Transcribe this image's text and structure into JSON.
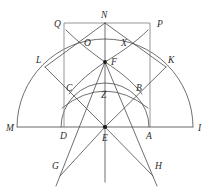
{
  "figure": {
    "width": 211,
    "height": 195,
    "stroke_color": "#4a4a4a",
    "baseline_color": "#6b6b6b",
    "rect_color": "#8a8a8a",
    "dot_color": "#1a1a1a",
    "background": "#ffffff"
  },
  "points": [
    {
      "id": "Q",
      "label": "Q",
      "x": 64,
      "y": 23,
      "lx": 54,
      "ly": 27,
      "dot": false
    },
    {
      "id": "N",
      "label": "N",
      "x": 105,
      "y": 23,
      "lx": 102,
      "ly": 18,
      "dot": false
    },
    {
      "id": "P",
      "label": "P",
      "x": 150,
      "y": 23,
      "lx": 157,
      "ly": 27,
      "dot": false
    },
    {
      "id": "L",
      "label": "L",
      "x": 48,
      "y": 65,
      "lx": 38,
      "ly": 62,
      "dot": false
    },
    {
      "id": "K",
      "label": "K",
      "x": 163,
      "y": 65,
      "lx": 168,
      "ly": 62,
      "dot": false
    },
    {
      "id": "O",
      "label": "O",
      "x": 92,
      "y": 45,
      "lx": 85,
      "ly": 44,
      "dot": false
    },
    {
      "id": "X",
      "label": "X",
      "x": 121,
      "y": 45,
      "lx": 122,
      "ly": 44,
      "dot": false
    },
    {
      "id": "F",
      "label": "F",
      "x": 105,
      "y": 62,
      "lx": 111,
      "ly": 63,
      "dot": true
    },
    {
      "id": "C",
      "label": "C",
      "x": 75,
      "y": 90,
      "lx": 67,
      "ly": 88,
      "dot": false
    },
    {
      "id": "B",
      "label": "B",
      "x": 135,
      "y": 90,
      "lx": 136,
      "ly": 88,
      "dot": false
    },
    {
      "id": "Z",
      "label": "Z",
      "x": 105,
      "y": 95,
      "lx": 102,
      "ly": 95,
      "dot": false
    },
    {
      "id": "M",
      "label": "M",
      "x": 18,
      "y": 127,
      "lx": 8,
      "ly": 130,
      "dot": false
    },
    {
      "id": "D",
      "label": "D",
      "x": 64,
      "y": 127,
      "lx": 60,
      "ly": 137,
      "dot": false
    },
    {
      "id": "E",
      "label": "E",
      "x": 105,
      "y": 127,
      "lx": 103,
      "ly": 139,
      "dot": true
    },
    {
      "id": "A",
      "label": "A",
      "x": 150,
      "y": 127,
      "lx": 147,
      "ly": 137,
      "dot": false
    },
    {
      "id": "I",
      "label": "I",
      "x": 194,
      "y": 127,
      "lx": 198,
      "ly": 130,
      "dot": false
    },
    {
      "id": "G",
      "label": "G",
      "x": 63,
      "y": 165,
      "lx": 52,
      "ly": 167,
      "dot": false
    },
    {
      "id": "H",
      "label": "H",
      "x": 150,
      "y": 165,
      "lx": 155,
      "ly": 167,
      "dot": false
    }
  ],
  "segments": [
    {
      "name": "baseline-MI",
      "x1": 18,
      "y1": 127,
      "x2": 194,
      "y2": 127,
      "kind": "base"
    },
    {
      "name": "rect-left-DQ",
      "x1": 64,
      "y1": 127,
      "x2": 64,
      "y2": 23,
      "kind": "rect"
    },
    {
      "name": "rect-top-QP",
      "x1": 64,
      "y1": 23,
      "x2": 150,
      "y2": 23,
      "kind": "rect"
    },
    {
      "name": "rect-right-PA",
      "x1": 150,
      "y1": 23,
      "x2": 150,
      "y2": 127,
      "kind": "rect"
    },
    {
      "name": "vertical-axis-NE",
      "x1": 105,
      "y1": 23,
      "x2": 105,
      "y2": 182,
      "kind": "line"
    },
    {
      "name": "ray-N-to-L",
      "x1": 105,
      "y1": 23,
      "x2": 45,
      "y2": 67,
      "kind": "line"
    },
    {
      "name": "ray-N-to-K",
      "x1": 105,
      "y1": 23,
      "x2": 166,
      "y2": 67,
      "kind": "line"
    },
    {
      "name": "chord-L-to-E",
      "x1": 45,
      "y1": 67,
      "x2": 105,
      "y2": 127,
      "kind": "line"
    },
    {
      "name": "chord-K-to-E",
      "x1": 166,
      "y1": 67,
      "x2": 105,
      "y2": 127,
      "kind": "line"
    },
    {
      "name": "ray-F-to-G",
      "x1": 105,
      "y1": 62,
      "x2": 56,
      "y2": 184,
      "kind": "line"
    },
    {
      "name": "ray-F-to-H",
      "x1": 105,
      "y1": 62,
      "x2": 157,
      "y2": 184,
      "kind": "line"
    },
    {
      "name": "ray-E-to-G",
      "x1": 105,
      "y1": 127,
      "x2": 64,
      "y2": 173,
      "kind": "line"
    },
    {
      "name": "ray-E-to-H",
      "x1": 105,
      "y1": 127,
      "x2": 149,
      "y2": 173,
      "kind": "line"
    },
    {
      "name": "ray-F-to-D",
      "x1": 105,
      "y1": 62,
      "x2": 64,
      "y2": 127,
      "kind": "line"
    },
    {
      "name": "ray-F-to-A",
      "x1": 105,
      "y1": 62,
      "x2": 150,
      "y2": 127,
      "kind": "line"
    }
  ],
  "arcs": [
    {
      "name": "outer-semicircle-MNI",
      "cx": 105,
      "cy": 127,
      "r": 88,
      "start_deg": 180,
      "end_deg": 0,
      "kind": "arc"
    },
    {
      "name": "inner-semicircle-DFA",
      "cx": 105,
      "cy": 127,
      "r": 44,
      "start_deg": 180,
      "end_deg": 0,
      "kind": "arc"
    },
    {
      "name": "flat-arc-C-Z-B",
      "cx": 105,
      "cy": 140,
      "r": 53,
      "start_deg": 215,
      "end_deg": 325,
      "kind": "arc"
    },
    {
      "name": "upper-arc-N-to-F-left",
      "cx": 64,
      "cy": 127,
      "r": 88,
      "start_deg": 285,
      "end_deg": 318,
      "kind": "arc"
    },
    {
      "name": "upper-arc-N-to-F-right",
      "cx": 150,
      "cy": 127,
      "r": 88,
      "start_deg": 222,
      "end_deg": 255,
      "kind": "arc"
    }
  ],
  "arc_paths": [
    {
      "name": "outer-semicircle",
      "d": "M 17 127 A 88 88 0 0 1 193 127"
    },
    {
      "name": "inner-semicircle",
      "d": "M 61 127 A 44 44 0 0 1 149 127"
    },
    {
      "name": "low-flat-arc",
      "d": "M 64 103 Q 105 78 147 103"
    },
    {
      "name": "left-upper-arc",
      "d": "M 64 23 A 92 92 0 0 0 105 62 A 92 92 0 0 0 134 120"
    },
    {
      "name": "right-upper-arc",
      "d": "M 150 23 A 92 92 0 0 1 105 62 A 92 92 0 0 1 76 120"
    }
  ]
}
